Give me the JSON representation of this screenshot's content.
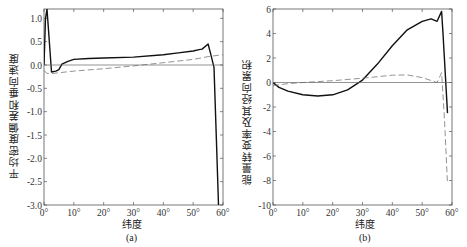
{
  "chart_data": [
    {
      "type": "line",
      "panel_label": "(a)",
      "title": "",
      "xlabel": "纬度",
      "ylabel": "平均密度偏差和垂向速度",
      "xlim": [
        0,
        60
      ],
      "ylim": [
        -3.0,
        1.2
      ],
      "x_ticks": [
        "0°",
        "10°",
        "20°",
        "30°",
        "40°",
        "50°",
        "60°"
      ],
      "y_ticks": [
        "1.0",
        "0.5",
        "0.0",
        "-0.5",
        "-1.0",
        "-1.5",
        "-2.0",
        "-2.5",
        "-3.0"
      ],
      "grid": false,
      "legend": "none",
      "series": [
        {
          "name": "solid (mean density deviation)",
          "style": "solid",
          "x": [
            0,
            0.5,
            1,
            2.5,
            4,
            5,
            6,
            8,
            10,
            15,
            20,
            30,
            40,
            45,
            50,
            52,
            53,
            55,
            56,
            57,
            58,
            58.5
          ],
          "y": [
            0,
            1.0,
            1.2,
            -0.15,
            -0.13,
            -0.1,
            0.02,
            0.08,
            0.12,
            0.14,
            0.15,
            0.17,
            0.22,
            0.26,
            0.3,
            0.33,
            0.34,
            0.45,
            0.2,
            -0.05,
            -2.0,
            -3.0
          ]
        },
        {
          "name": "dashed (vertical velocity)",
          "style": "dashed",
          "x": [
            0,
            1,
            3,
            10,
            20,
            30,
            40,
            50,
            55,
            60
          ],
          "y": [
            -0.12,
            -0.18,
            -0.18,
            -0.13,
            -0.08,
            -0.02,
            0.05,
            0.12,
            0.18,
            0.22
          ]
        },
        {
          "name": "zero line",
          "style": "thin",
          "x": [
            0,
            60
          ],
          "y": [
            0,
            0
          ]
        }
      ]
    },
    {
      "type": "line",
      "panel_label": "(b)",
      "title": "",
      "xlabel": "纬度",
      "ylabel": "能量转变率及其经向累积",
      "xlim": [
        0,
        60
      ],
      "ylim": [
        -10,
        6
      ],
      "x_ticks": [
        "0°",
        "10°",
        "20°",
        "30°",
        "40°",
        "50°",
        "60°"
      ],
      "y_ticks": [
        "6",
        "4",
        "2",
        "0",
        "-2",
        "-4",
        "-6",
        "-8",
        "-10"
      ],
      "grid": false,
      "legend": "none",
      "series": [
        {
          "name": "solid (meridional accumulation)",
          "style": "solid",
          "x": [
            0,
            2,
            5,
            10,
            15,
            20,
            25,
            30,
            35,
            40,
            45,
            50,
            53,
            55,
            56.5,
            57,
            58.5
          ],
          "y": [
            0,
            -0.4,
            -0.7,
            -1.0,
            -1.1,
            -1.0,
            -0.6,
            0.2,
            1.5,
            3.0,
            4.3,
            5.0,
            5.2,
            5.0,
            5.8,
            4.0,
            -2.5
          ]
        },
        {
          "name": "dashed (energy conversion rate)",
          "style": "dashed",
          "x": [
            0,
            5,
            10,
            20,
            30,
            40,
            45,
            50,
            55,
            56.5,
            57.5,
            58.5
          ],
          "y": [
            -0.25,
            -0.1,
            0.0,
            0.15,
            0.35,
            0.6,
            0.62,
            0.4,
            0.0,
            0.8,
            -3.0,
            -8.3
          ]
        },
        {
          "name": "zero line",
          "style": "thin",
          "x": [
            0,
            60
          ],
          "y": [
            0,
            0
          ]
        }
      ]
    }
  ],
  "panels": {
    "a": {
      "label": "(a)",
      "xlabel": "纬度",
      "ylabel": "平均密度偏差和垂向速度"
    },
    "b": {
      "label": "(b)",
      "xlabel": "纬度",
      "ylabel": "能量转变率及其经向累积"
    }
  }
}
